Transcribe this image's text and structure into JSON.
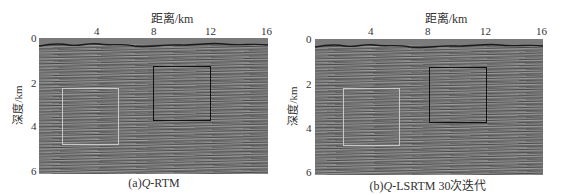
{
  "figure": {
    "panels": [
      {
        "id": "a",
        "caption_prefix": "(a)",
        "caption_italic": "Q",
        "caption_suffix": "-RTM",
        "xlabel": "距离/km",
        "ylabel": "深度/km",
        "xticks": [
          "4",
          "8",
          "12",
          "16"
        ],
        "yticks": [
          "0",
          "2",
          "4",
          "6"
        ],
        "boxes": [
          {
            "color": "#c8c8c8",
            "label": "light-box",
            "x_km": [
              1.6,
              5.6
            ],
            "y_km": [
              2.3,
              4.7
            ]
          },
          {
            "color": "#111111",
            "label": "dark-box",
            "x_km": [
              8.0,
              12.0
            ],
            "y_km": [
              1.4,
              3.8
            ]
          }
        ]
      },
      {
        "id": "b",
        "caption_prefix": "(b)",
        "caption_italic": "Q",
        "caption_suffix": "-LSRTM 30次迭代",
        "xlabel": "距离/km",
        "ylabel": "深度/km",
        "xticks": [
          "4",
          "8",
          "12",
          "16"
        ],
        "yticks": [
          "0",
          "2",
          "4",
          "6"
        ],
        "boxes": [
          {
            "color": "#c8c8c8",
            "label": "light-box",
            "x_km": [
              2.0,
              6.0
            ],
            "y_km": [
              2.3,
              4.7
            ]
          },
          {
            "color": "#111111",
            "label": "dark-box",
            "x_km": [
              8.0,
              12.0
            ],
            "y_km": [
              1.4,
              3.8
            ]
          }
        ]
      }
    ],
    "axis": {
      "x_range_km": [
        0,
        16
      ],
      "y_range_km": [
        0,
        6
      ]
    }
  }
}
